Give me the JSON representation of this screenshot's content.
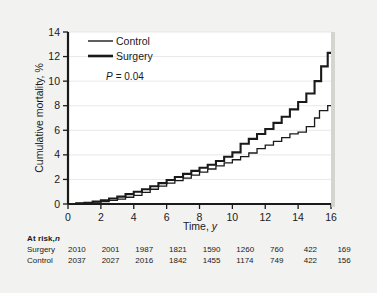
{
  "chart_data": {
    "type": "line",
    "title": "",
    "xlabel": "Time, y",
    "ylabel": "Cumulative mortality, %",
    "xlim": [
      0,
      16
    ],
    "ylim": [
      0,
      14
    ],
    "xticks": [
      0,
      2,
      4,
      6,
      8,
      10,
      12,
      14,
      16
    ],
    "yticks": [
      0,
      2,
      4,
      6,
      8,
      10,
      12,
      14
    ],
    "grid": "horizontal",
    "legend_position": "top-left",
    "annotation": "P = 0.04",
    "annotation_p_symbol": "P",
    "annotation_p_value": "= 0.04",
    "series": [
      {
        "name": "Control",
        "style": "thin-step",
        "final_value": 8.0,
        "x": [
          0,
          0.5,
          1,
          1.5,
          2,
          2.5,
          3,
          3.5,
          4,
          4.5,
          5,
          5.5,
          6,
          6.5,
          7,
          7.5,
          8,
          8.5,
          9,
          9.5,
          10,
          10.5,
          11,
          11.5,
          12,
          12.5,
          13,
          13.5,
          14,
          14.5,
          15,
          15.3,
          15.8,
          16
        ],
        "values": [
          0,
          0.05,
          0.1,
          0.15,
          0.2,
          0.3,
          0.4,
          0.55,
          0.7,
          0.95,
          1.2,
          1.45,
          1.7,
          1.9,
          2.1,
          2.35,
          2.6,
          2.85,
          3.1,
          3.35,
          3.6,
          3.85,
          4.15,
          4.5,
          4.8,
          5.1,
          5.4,
          5.7,
          5.85,
          6.3,
          7.0,
          7.6,
          8.0,
          8.0
        ]
      },
      {
        "name": "Surgery",
        "style": "thick-step",
        "final_value": 12.3,
        "x": [
          0,
          0.5,
          1,
          1.5,
          2,
          2.5,
          3,
          3.5,
          4,
          4.5,
          5,
          5.5,
          6,
          6.5,
          7,
          7.5,
          8,
          8.5,
          9,
          9.5,
          10,
          10.5,
          11,
          11.5,
          12,
          12.5,
          13,
          13.5,
          14,
          14.5,
          15,
          15.4,
          15.8,
          16
        ],
        "values": [
          0,
          0.05,
          0.1,
          0.2,
          0.3,
          0.45,
          0.6,
          0.8,
          1.0,
          1.2,
          1.45,
          1.7,
          1.95,
          2.2,
          2.45,
          2.7,
          2.95,
          3.2,
          3.5,
          3.85,
          4.2,
          4.9,
          5.3,
          5.7,
          6.1,
          6.6,
          7.1,
          7.7,
          8.3,
          9.0,
          10.0,
          11.2,
          12.3,
          12.3
        ]
      }
    ]
  },
  "legend": {
    "entries": [
      {
        "label": "Control"
      },
      {
        "label": "Surgery"
      }
    ]
  },
  "at_risk": {
    "title_bold": "At risk,",
    "title_italic": "n",
    "rows": [
      {
        "label": "Surgery",
        "values": [
          "2010",
          "2001",
          "1987",
          "1821",
          "1590",
          "1260",
          "760",
          "422",
          "169"
        ]
      },
      {
        "label": "Control",
        "values": [
          "2037",
          "2027",
          "2016",
          "1842",
          "1455",
          "1174",
          "749",
          "422",
          "156"
        ]
      }
    ]
  },
  "colors": {
    "background": "#f2f2f0",
    "plot_background": "#ffffff",
    "line": "#1a1a1a",
    "grid": "#e2e2e2",
    "text": "#1a1a1a"
  }
}
